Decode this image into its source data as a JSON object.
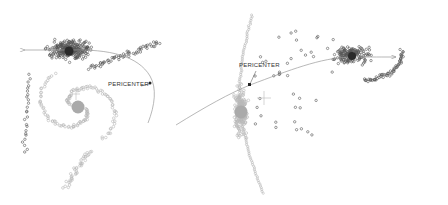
{
  "panels": [
    {
      "id": "left",
      "pericenter_label": "PERICENTER"
    },
    {
      "id": "right",
      "pericenter_label": "PERICENTER"
    }
  ],
  "colors": {
    "background": "#ffffff",
    "companion_particles": "#555555",
    "companion_core": "#2a2a2a",
    "host_particles": "#b8b8b8",
    "host_core": "#a8a8a8",
    "orbit_line": "#9a9a9a",
    "pericenter_marker": "#222222"
  }
}
